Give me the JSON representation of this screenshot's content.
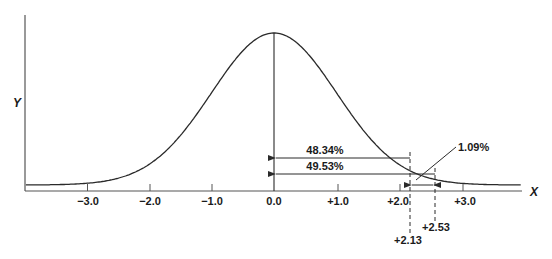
{
  "chart_data": {
    "type": "diagram",
    "title": "",
    "xlabel": "X",
    "ylabel": "Y",
    "x_ticks": [
      "-3.0",
      "-2.0",
      "-1.0",
      "0.0",
      "+1.0",
      "+2.0",
      "+3.0"
    ],
    "x_tick_values": [
      -3.0,
      -2.0,
      -1.0,
      0.0,
      1.0,
      2.0,
      3.0
    ],
    "xlim": [
      -4.0,
      4.0
    ],
    "markers": [
      {
        "label": "+2.13",
        "value": 2.13
      },
      {
        "label": "+2.53",
        "value": 2.53
      }
    ],
    "areas": [
      {
        "label": "48.34%",
        "from": 0.0,
        "to": 2.13
      },
      {
        "label": "49.53%",
        "from": 0.0,
        "to": 2.53
      },
      {
        "label": "1.09%",
        "from": 2.13,
        "to": 2.53
      }
    ],
    "colors": {
      "line": "#2a2a2a",
      "text": "#1a1a1a",
      "background": "#ffffff"
    }
  },
  "labels": {
    "x_axis": "X",
    "y_axis": "Y",
    "tick_neg3": "−3.0",
    "tick_neg2": "−2.0",
    "tick_neg1": "−1.0",
    "tick_0": "0.0",
    "tick_pos1": "+1.0",
    "tick_pos2": "+2.0",
    "tick_pos3": "+3.0",
    "marker_213": "+2.13",
    "marker_253": "+2.53",
    "area_4834": "48.34%",
    "area_4953": "49.53%",
    "area_109": "1.09%"
  }
}
